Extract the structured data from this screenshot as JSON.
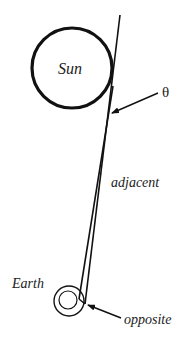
{
  "diagram": {
    "labels": {
      "sun": "Sun",
      "earth": "Earth",
      "theta": "θ",
      "adjacent": "adjacent",
      "opposite": "opposite"
    },
    "colors": {
      "stroke": "#111111",
      "background": "#ffffff"
    }
  }
}
